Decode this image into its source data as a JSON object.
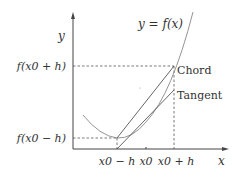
{
  "diagram": {
    "curve_label": "y = f(x)",
    "axes": {
      "x_label": "x",
      "y_label": "y"
    },
    "x_ticks": [
      "x0 − h",
      "x0",
      "x0 + h"
    ],
    "y_ticks": [
      "f(x0 + h)",
      "f(x0 − h)"
    ],
    "lines": {
      "chord_label": "Chord",
      "tangent_label": "Tangent"
    },
    "colors": {
      "axis": "#444444",
      "curve": "#777777",
      "lines": "#555555",
      "dashed": "#555555",
      "text": "#333333"
    }
  }
}
